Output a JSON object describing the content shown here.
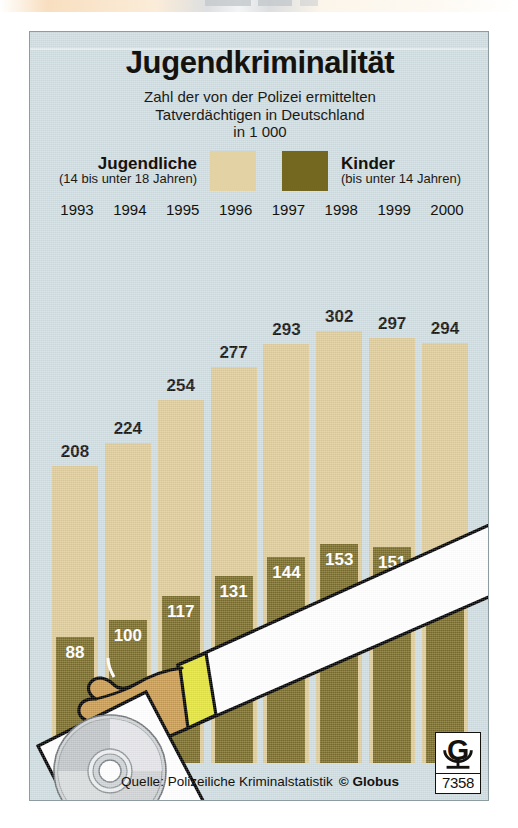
{
  "poster": {
    "title": "Jugendkriminalität",
    "subtitle_lines": [
      "Zahl der von der Polizei ermittelten",
      "Tatverdächtigen in Deutschland",
      "in 1 000"
    ],
    "source_text": "Quelle: Polizeiliche Kriminalstatistik",
    "copyright": "© Globus",
    "logo_letter": "G",
    "logo_number": "7358",
    "colors": {
      "background": "#cfdde0",
      "teen_bar": "#ddcb9a",
      "kids_bar": "#7a6b28",
      "text": "#14120f",
      "sleeve_cuff": "#e3e33a",
      "skin": "#c89a50"
    }
  },
  "legend": {
    "teen_name": "Jugendliche",
    "teen_sub": "(14 bis unter 18 Jahren)",
    "kids_name": "Kinder",
    "kids_sub": "(bis unter 14 Jahren)"
  },
  "chart_data": {
    "type": "bar",
    "title": "Jugendkriminalität",
    "subtitle": "Zahl der von der Polizei ermittelten Tatverdächtigen in Deutschland in 1 000",
    "xlabel": "",
    "ylabel": "in 1 000",
    "categories": [
      "1993",
      "1994",
      "1995",
      "1996",
      "1997",
      "1998",
      "1999",
      "2000"
    ],
    "series": [
      {
        "name": "Jugendliche",
        "sublabel": "(14 bis unter 18 Jahren)",
        "color": "#ddcb9a",
        "values": [
          208,
          224,
          254,
          277,
          293,
          302,
          297,
          294
        ]
      },
      {
        "name": "Kinder",
        "sublabel": "(bis unter 14 Jahren)",
        "color": "#7a6b28",
        "values": [
          88,
          100,
          117,
          131,
          144,
          153,
          151,
          146
        ]
      }
    ],
    "ylim": [
      0,
      330
    ],
    "grid": false,
    "legend_position": "top",
    "note": "Kinder bars are drawn overlapping in front of the Jugendliche bars, sharing a common baseline."
  }
}
